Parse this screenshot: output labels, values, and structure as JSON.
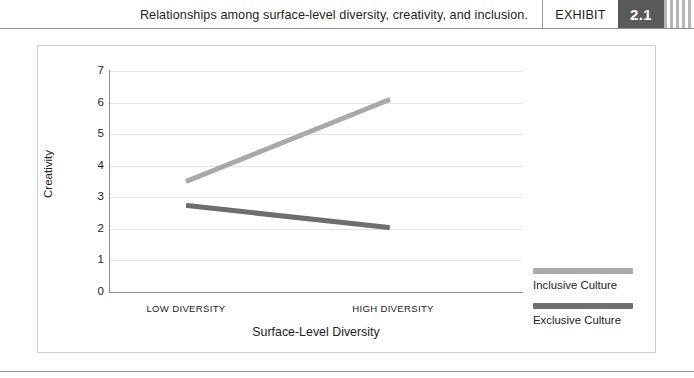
{
  "header": {
    "caption": "Relationships among surface-level diversity, creativity, and inclusion.",
    "exhibit_label": "EXHIBIT",
    "exhibit_number": "2.1",
    "stripe_decoration": "vertical-stripes"
  },
  "chart_data": {
    "type": "line",
    "title": "Relationships among surface-level diversity, creativity, and inclusion.",
    "xlabel": "Surface-Level Diversity",
    "ylabel": "Creativity",
    "categories": [
      "LOW DIVERSITY",
      "HIGH DIVERSITY"
    ],
    "ytick_labels": [
      "7",
      "6",
      "5",
      "4",
      "3",
      "2",
      "1",
      "0"
    ],
    "yticks": [
      7,
      6,
      5,
      4,
      3,
      2,
      1,
      0
    ],
    "ylim": [
      0,
      7
    ],
    "grid": true,
    "legend_position": "right",
    "series": [
      {
        "name": "Inclusive Culture",
        "values": [
          3.5,
          6.1
        ],
        "color": "#a9a9a9"
      },
      {
        "name": "Exclusive Culture",
        "values": [
          2.75,
          2.05
        ],
        "color": "#6e6e6e"
      }
    ]
  }
}
